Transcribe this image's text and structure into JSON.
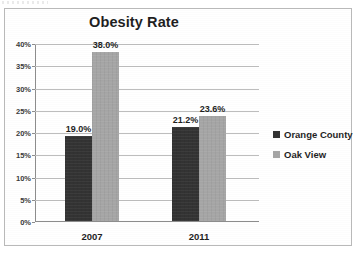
{
  "chart_data": {
    "type": "bar",
    "title": "Obesity Rate",
    "xlabel": "",
    "ylabel": "",
    "categories": [
      "2007",
      "2011"
    ],
    "series": [
      {
        "name": "Orange County",
        "color": "#333333",
        "values": [
          19.0,
          21.2
        ],
        "labels": [
          "19.0%",
          "23.6%"
        ]
      },
      {
        "name": "Oak View",
        "color": "#a6a6a6",
        "values": [
          38.0,
          23.6
        ],
        "labels": [
          "38.0%",
          "23.6%"
        ]
      }
    ],
    "points": [
      {
        "category": "2007",
        "series": "Orange County",
        "value": 19.0,
        "label": "19.0%"
      },
      {
        "category": "2007",
        "series": "Oak View",
        "value": 38.0,
        "label": "38.0%"
      },
      {
        "category": "2011",
        "series": "Orange County",
        "value": 21.2,
        "label": "21.2%"
      },
      {
        "category": "2011",
        "series": "Oak View",
        "value": 23.6,
        "label": "23.6%"
      }
    ],
    "ylim": [
      0,
      40
    ],
    "ytick_values": [
      40,
      35,
      30,
      25,
      20,
      15,
      10,
      5,
      0
    ],
    "ytick_labels": [
      "40%",
      "35%",
      "30%",
      "25%",
      "20%",
      "15%",
      "10%",
      "5%",
      "0%"
    ],
    "grid": true,
    "grid_axis": "y",
    "legend_position": "right",
    "legend_entries": [
      "Orange County",
      "Oak View"
    ]
  },
  "frame": {
    "border_color": "#b9b9b9"
  }
}
